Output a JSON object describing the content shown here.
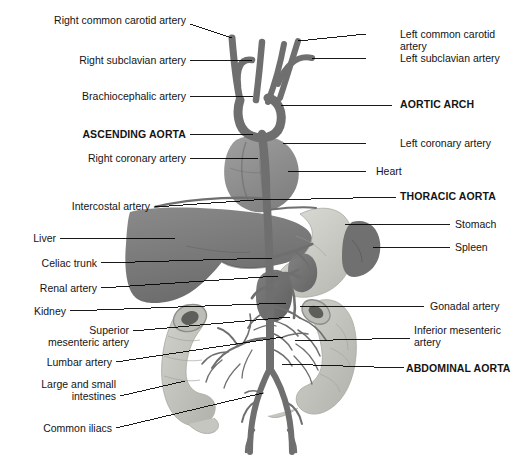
{
  "figure": {
    "background_color": "#ffffff",
    "label_color": "#141414",
    "leader_color": "#000000",
    "palette": {
      "vessel_dark": "#6f6f6f",
      "vessel_mid": "#7d7d7d",
      "liver": "#7a7a7a",
      "heart": "#8e8e8e",
      "kidney": "#6e6e6e",
      "spleen": "#737373",
      "stomach": "#c9c9c4",
      "intestine": "#c2c2bd"
    },
    "labels_left": [
      {
        "id": "right-common-carotid-artery",
        "text": "Right common carotid artery",
        "bold": false,
        "x": 36,
        "y": 14,
        "width": 150,
        "leader": [
          [
            190,
            24
          ],
          [
            232,
            38
          ]
        ]
      },
      {
        "id": "right-subclavian-artery",
        "text": "Right subclavian artery",
        "bold": false,
        "x": 12,
        "y": 54,
        "width": 174,
        "leader": [
          [
            190,
            60
          ],
          [
            252,
            60
          ]
        ]
      },
      {
        "id": "brachiocephalic-artery",
        "text": "Brachiocephalic artery",
        "bold": false,
        "x": 22,
        "y": 90,
        "width": 164,
        "leader": [
          [
            190,
            96
          ],
          [
            253,
            96
          ]
        ]
      },
      {
        "id": "ascending-aorta",
        "text": "ASCENDING AORTA",
        "bold": true,
        "x": 18,
        "y": 128,
        "width": 168,
        "leader": [
          [
            190,
            134
          ],
          [
            253,
            134
          ]
        ]
      },
      {
        "id": "right-coronary-artery",
        "text": "Right coronary artery",
        "bold": false,
        "x": 24,
        "y": 152,
        "width": 162,
        "leader": [
          [
            190,
            158
          ],
          [
            258,
            158
          ]
        ]
      },
      {
        "id": "intercostal-artery",
        "text": "Intercostal artery",
        "bold": false,
        "x": 22,
        "y": 200,
        "width": 128,
        "leader": [
          [
            155,
            207
          ],
          [
            268,
            199
          ]
        ]
      },
      {
        "id": "liver",
        "text": "Liver",
        "bold": false,
        "x": 22,
        "y": 232,
        "width": 34,
        "leader": [
          [
            60,
            238
          ],
          [
            175,
            238
          ]
        ]
      },
      {
        "id": "celiac-trunk",
        "text": "Celiac trunk",
        "bold": false,
        "x": 17,
        "y": 257,
        "width": 80,
        "leader": [
          [
            101,
            263
          ],
          [
            272,
            258
          ]
        ]
      },
      {
        "id": "renal-artery",
        "text": "Renal artery",
        "bold": false,
        "x": 17,
        "y": 282,
        "width": 80,
        "leader": [
          [
            101,
            288
          ],
          [
            278,
            276
          ]
        ]
      },
      {
        "id": "kidney",
        "text": "Kidney",
        "bold": false,
        "x": 21,
        "y": 305,
        "width": 45,
        "leader": [
          [
            70,
            311
          ],
          [
            286,
            303
          ]
        ]
      },
      {
        "id": "superior-mesenteric-artery",
        "text": "Superior\nmesenteric artery",
        "bold": false,
        "x": 16,
        "y": 324,
        "width": 113,
        "leader": [
          [
            133,
            331
          ],
          [
            290,
            317
          ]
        ]
      },
      {
        "id": "lumbar-artery",
        "text": "Lumbar artery",
        "bold": false,
        "x": 24,
        "y": 356,
        "width": 88,
        "leader": [
          [
            116,
            362
          ],
          [
            283,
            337
          ]
        ]
      },
      {
        "id": "large-and-small-intestines",
        "text": "Large and small\nintestines",
        "bold": false,
        "x": 16,
        "y": 378,
        "width": 100,
        "leader": [
          [
            120,
            396
          ],
          [
            185,
            381
          ]
        ]
      },
      {
        "id": "common-iliacs",
        "text": "Common iliacs",
        "bold": false,
        "x": 22,
        "y": 422,
        "width": 90,
        "leader": [
          [
            116,
            428
          ],
          [
            263,
            393
          ]
        ]
      }
    ],
    "labels_right": [
      {
        "id": "left-common-carotid-artery",
        "text": "Left common carotid artery",
        "bold": false,
        "x": 400,
        "y": 28,
        "width": 120,
        "leader": [
          [
            366,
            34
          ],
          [
            298,
            41
          ]
        ]
      },
      {
        "id": "left-subclavian-artery",
        "text": "Left subclavian artery",
        "bold": false,
        "x": 400,
        "y": 52,
        "width": 120,
        "leader": [
          [
            366,
            58
          ],
          [
            312,
            58
          ]
        ]
      },
      {
        "id": "aortic-arch",
        "text": "AORTIC ARCH",
        "bold": true,
        "x": 400,
        "y": 98,
        "width": 120,
        "leader": [
          [
            392,
            105
          ],
          [
            281,
            105
          ]
        ]
      },
      {
        "id": "left-coronary-artery",
        "text": "Left coronary artery",
        "bold": false,
        "x": 400,
        "y": 137,
        "width": 120,
        "leader": [
          [
            366,
            143
          ],
          [
            283,
            143
          ]
        ]
      },
      {
        "id": "heart",
        "text": "Heart",
        "bold": false,
        "x": 376,
        "y": 165,
        "width": 60,
        "leader": [
          [
            366,
            171
          ],
          [
            288,
            171
          ]
        ]
      },
      {
        "id": "thoracic-aorta",
        "text": "THORACIC AORTA",
        "bold": true,
        "x": 400,
        "y": 190,
        "width": 120,
        "leader": [
          [
            396,
            197
          ],
          [
            268,
            200
          ]
        ]
      },
      {
        "id": "stomach",
        "text": "Stomach",
        "bold": false,
        "x": 455,
        "y": 218,
        "width": 62,
        "leader": [
          [
            450,
            224
          ],
          [
            345,
            224
          ]
        ]
      },
      {
        "id": "spleen",
        "text": "Spleen",
        "bold": false,
        "x": 455,
        "y": 241,
        "width": 62,
        "leader": [
          [
            450,
            247
          ],
          [
            373,
            247
          ]
        ]
      },
      {
        "id": "gonadal-artery",
        "text": "Gonadal artery",
        "bold": false,
        "x": 430,
        "y": 300,
        "width": 90,
        "leader": [
          [
            424,
            306
          ],
          [
            300,
            306
          ]
        ]
      },
      {
        "id": "inferior-mesenteric-artery",
        "text": "Inferior mesenteric\nartery",
        "bold": false,
        "x": 414,
        "y": 324,
        "width": 106,
        "leader": [
          [
            410,
            338
          ],
          [
            295,
            341
          ]
        ]
      },
      {
        "id": "abdominal-aorta",
        "text": "ABDOMINAL AORTA",
        "bold": true,
        "x": 406,
        "y": 362,
        "width": 114,
        "leader": [
          [
            404,
            368
          ],
          [
            282,
            364
          ]
        ]
      }
    ]
  }
}
